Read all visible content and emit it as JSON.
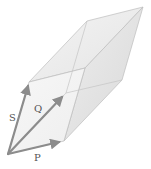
{
  "diagram": {
    "type": "parallelepiped-vectors",
    "vectors": [
      {
        "name": "P",
        "label": "P"
      },
      {
        "name": "Q",
        "label": "Q"
      },
      {
        "name": "S",
        "label": "S"
      }
    ],
    "colors": {
      "vector": "#8c8c8c",
      "edge": "#b9b9b9",
      "face_light": "#f2f2f2",
      "face_mid": "#e6e6e6",
      "face_dark": "#dadada",
      "label": "#555555"
    }
  }
}
